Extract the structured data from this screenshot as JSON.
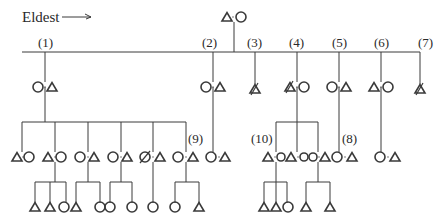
{
  "diagram": {
    "title_label": "Eldest",
    "arrow": "right-arrow",
    "colors": {
      "line": "#3a3a3a",
      "text": "#2a2a2a",
      "background": "#ffffff"
    },
    "legend": {
      "triangle": "male",
      "circle": "female",
      "slashed": "deceased"
    },
    "top_couple": {
      "x": 234,
      "y": 17,
      "left": "triangle",
      "right": "circle"
    },
    "sibling_line": {
      "y": 52,
      "x1": 22,
      "x2": 420
    },
    "sibling_labels": [
      {
        "text": "(1)",
        "x": 45
      },
      {
        "text": "(2)",
        "x": 210
      },
      {
        "text": "(3)",
        "x": 257
      },
      {
        "text": "(4)",
        "x": 298
      },
      {
        "text": "(5)",
        "x": 340
      },
      {
        "text": "(6)",
        "x": 381
      },
      {
        "text": "(7)",
        "x": 425
      }
    ],
    "extra_labels": [
      {
        "text": "(9)",
        "x": 197,
        "y": 146
      },
      {
        "text": "(10)",
        "x": 267,
        "y": 146
      },
      {
        "text": "(8)",
        "x": 349,
        "y": 146
      }
    ],
    "generation_2": [
      {
        "id": 1,
        "x": 45,
        "pair": [
          "circle",
          "triangle"
        ]
      },
      {
        "id": 2,
        "x": 213,
        "pair": [
          "circle",
          "triangle"
        ]
      },
      {
        "id": 3,
        "x": 255,
        "pair": [
          "triangle-slashed"
        ]
      },
      {
        "id": 4,
        "x": 297,
        "pair": [
          "triangle-slashed",
          "circle"
        ]
      },
      {
        "id": 5,
        "x": 339,
        "pair": [
          "circle",
          "triangle"
        ]
      },
      {
        "id": 6,
        "x": 381,
        "pair": [
          "triangle",
          "circle"
        ]
      },
      {
        "id": 7,
        "x": 420,
        "pair": [
          "triangle-slashed"
        ]
      }
    ],
    "generation_3": [
      {
        "x": 22,
        "pair": [
          "triangle",
          "circle"
        ]
      },
      {
        "x": 55,
        "pair": [
          "triangle",
          "circle"
        ]
      },
      {
        "x": 88,
        "pair": [
          "circle",
          "triangle"
        ]
      },
      {
        "x": 121,
        "pair": [
          "circle",
          "triangle"
        ]
      },
      {
        "x": 153,
        "pair": [
          "circle-slashed",
          "triangle"
        ]
      },
      {
        "x": 186,
        "pair": [
          "circle",
          "triangle"
        ]
      },
      {
        "x": 213,
        "pair": [
          "circle",
          "triangle"
        ]
      },
      {
        "x": 276,
        "pair": [
          "triangle",
          "circle",
          "triangle",
          "circle",
          "circle",
          "triangle"
        ]
      },
      {
        "x": 339,
        "pair": [
          "circle",
          "triangle"
        ]
      },
      {
        "x": 381,
        "pair": [
          "circle",
          "triangle"
        ]
      }
    ],
    "generation_4": [
      {
        "parent_x": 55,
        "children": [
          "triangle",
          "triangle",
          "circle"
        ]
      },
      {
        "parent_x": 88,
        "children": [
          "triangle",
          "circle"
        ]
      },
      {
        "parent_x": 121,
        "children": [
          "circle",
          "circle"
        ]
      },
      {
        "parent_x": 153,
        "children": [
          "circle"
        ]
      },
      {
        "parent_x": 186,
        "children": [
          "circle",
          "triangle"
        ]
      },
      {
        "parent_x": 276,
        "children": [
          "triangle",
          "triangle",
          "circle"
        ]
      },
      {
        "parent_x": 318,
        "children": [
          "triangle",
          "triangle"
        ]
      }
    ]
  }
}
